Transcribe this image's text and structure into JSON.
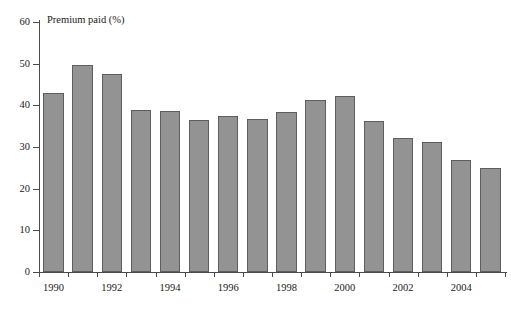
{
  "chart_data": {
    "type": "bar",
    "title": "",
    "xlabel": "",
    "ylabel": "Premium paid (%)",
    "ylim": [
      0,
      60
    ],
    "ytick_values": [
      0,
      10,
      20,
      30,
      40,
      50,
      60
    ],
    "ytick_labels": [
      "0",
      "10",
      "20",
      "30",
      "40",
      "50",
      "60"
    ],
    "grid": false,
    "legend": false,
    "bar_color": "#939393",
    "bar_edge_color": "#5e5e5e",
    "axis_color": "#4a4a4a",
    "categories": [
      "1990",
      "1991",
      "1992",
      "1993",
      "1994",
      "1995",
      "1996",
      "1997",
      "1998",
      "1999",
      "2000",
      "2001",
      "2002",
      "2003",
      "2004",
      "2005"
    ],
    "xtick_labels_shown": [
      "1990",
      "1992",
      "1994",
      "1996",
      "1998",
      "2000",
      "2002",
      "2004"
    ],
    "values": [
      43.0,
      49.8,
      47.6,
      38.8,
      38.6,
      36.4,
      37.4,
      36.8,
      38.4,
      41.4,
      42.3,
      36.2,
      32.2,
      31.2,
      27.0,
      25.0
    ]
  }
}
